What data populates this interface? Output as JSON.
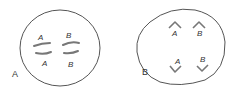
{
  "panels": [
    {
      "id": "A",
      "label": "A",
      "description": "Cell with two homologous chromosome pairs aligned",
      "chromosome_labels": {
        "top_left": "A",
        "top_right": "B",
        "bottom_left": "A",
        "bottom_right": "B"
      }
    },
    {
      "id": "B",
      "label": "B",
      "description": "Cell with chromosomes separating toward poles",
      "chromosome_labels": {
        "top_left": "A",
        "top_right": "B",
        "bottom_left": "A",
        "bottom_right": "B"
      }
    }
  ],
  "colors": {
    "stroke": "#555555",
    "chromosome": "#777777",
    "text": "#333333"
  }
}
